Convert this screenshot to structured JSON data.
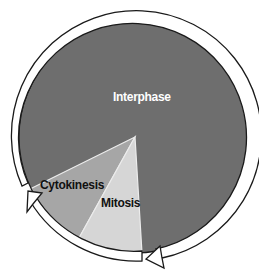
{
  "diagram": {
    "type": "cell-cycle",
    "phases": [
      {
        "name": "Interphase",
        "color": "#6e6e6e",
        "label_color": "#ffffff"
      },
      {
        "name": "Cytokinesis",
        "color": "#a6a6a6",
        "label_color": "#111111"
      },
      {
        "name": "Mitosis",
        "color": "#d6d6d6",
        "label_color": "#111111"
      }
    ],
    "arrow_color": "#ffffff",
    "outline_color": "#1a1a1a"
  }
}
